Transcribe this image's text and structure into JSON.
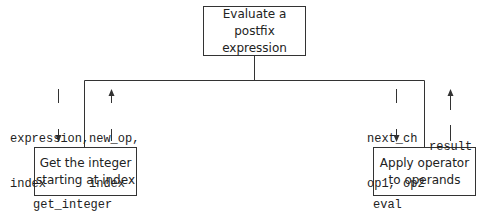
{
  "diagram": {
    "type": "structure-chart",
    "root": {
      "label_line1": "Evaluate a",
      "label_line2": "postfix expression"
    },
    "children": [
      {
        "label_line1": "Get the integer",
        "label_line2": "starting at index",
        "module_name": "get_integer",
        "down_params_line1": "expression,",
        "down_params_line2": "index",
        "up_params_line1": "new_op,",
        "up_params_line2": "index"
      },
      {
        "label_line1": "Apply operator",
        "label_line2": "to operands",
        "module_name": "eval",
        "down_params_line1": "next_ch",
        "down_params_line2": "op1, op2",
        "up_params_line1": "result"
      }
    ],
    "colors": {
      "line": "#333333",
      "text": "#222222",
      "background": "#ffffff"
    }
  }
}
